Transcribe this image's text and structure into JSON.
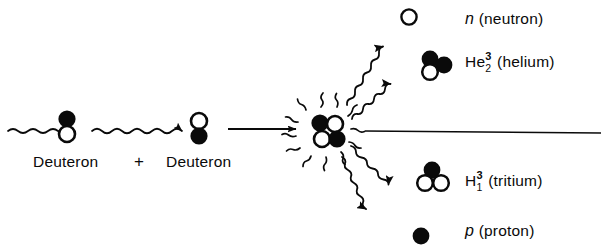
{
  "diagram": {
    "background_color": "#ffffff",
    "ink_color": "#0a0a0a"
  },
  "reactants": {
    "left_label": "Deuteron",
    "plus": "+",
    "right_label": "Deuteron"
  },
  "products": {
    "neutron": {
      "symbol": "n",
      "name": "(neutron)"
    },
    "helium": {
      "symbol": "He",
      "superscript": "3",
      "subscript": "2",
      "name": "(helium)"
    },
    "tritium": {
      "symbol": "H",
      "superscript": "3",
      "subscript": "1",
      "name": "(tritium)"
    },
    "proton": {
      "symbol": "p",
      "name": "(proton)"
    }
  },
  "particles": {
    "neutron_fill": "#0a0a0a",
    "proton_fill": "#ffffff",
    "stroke": "#0a0a0a"
  }
}
